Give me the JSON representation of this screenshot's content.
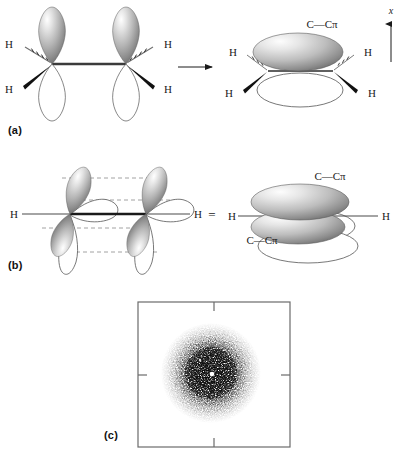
{
  "figure": {
    "panels": [
      {
        "id": "a",
        "label": "(a)",
        "description": "Two sp2 carbons with unhybridized p orbitals combining to form a C-C pi bond"
      },
      {
        "id": "b",
        "label": "(b)",
        "description": "Perpendicular p orbital view resolving into two C-C pi lobes"
      },
      {
        "id": "c",
        "label": "(c)",
        "description": "Stippled electron density plot of the pi electron cloud"
      }
    ]
  },
  "panel_a": {
    "label": "(a)",
    "left_structure": {
      "hydrogens": [
        {
          "text": "H",
          "bond": "hashed"
        },
        {
          "text": "H",
          "bond": "wedge"
        },
        {
          "text": "H",
          "bond": "hashed"
        },
        {
          "text": "H",
          "bond": "wedge"
        }
      ]
    },
    "arrow": "reaction-arrow-right",
    "right_structure": {
      "pi_label": "C—Cπ",
      "hydrogens": [
        {
          "text": "H",
          "bond": "hashed"
        },
        {
          "text": "H",
          "bond": "wedge"
        },
        {
          "text": "H",
          "bond": "hashed"
        },
        {
          "text": "H",
          "bond": "wedge"
        }
      ]
    },
    "axis": {
      "label": "x",
      "direction": "up"
    }
  },
  "panel_b": {
    "label": "(b)",
    "left_structure": {
      "hydrogens": [
        {
          "text": "H"
        },
        {
          "text": "H"
        }
      ],
      "dashed_guides": 4
    },
    "equals": "=",
    "right_structure": {
      "hydrogens": [
        {
          "text": "H"
        },
        {
          "text": "H"
        }
      ],
      "pi_label_top": "C—Cπ",
      "pi_label_bottom": "C—Cπ"
    }
  },
  "panel_c": {
    "label": "(c)",
    "plot": {
      "frame": "square",
      "ticks": [
        "top-center",
        "right-center",
        "bottom-center",
        "left-center"
      ],
      "content": "electron-density-stipple-cloud"
    }
  },
  "colors": {
    "background": "#ffffff",
    "ink": "#1a1a1a",
    "frame": "#6b6b6b",
    "orbital_light": "#f2f2f2",
    "orbital_mid": "#b9b9b9",
    "orbital_dark": "#6a6a6a",
    "outline": "#555555",
    "dashed": "#8c8c8c"
  }
}
